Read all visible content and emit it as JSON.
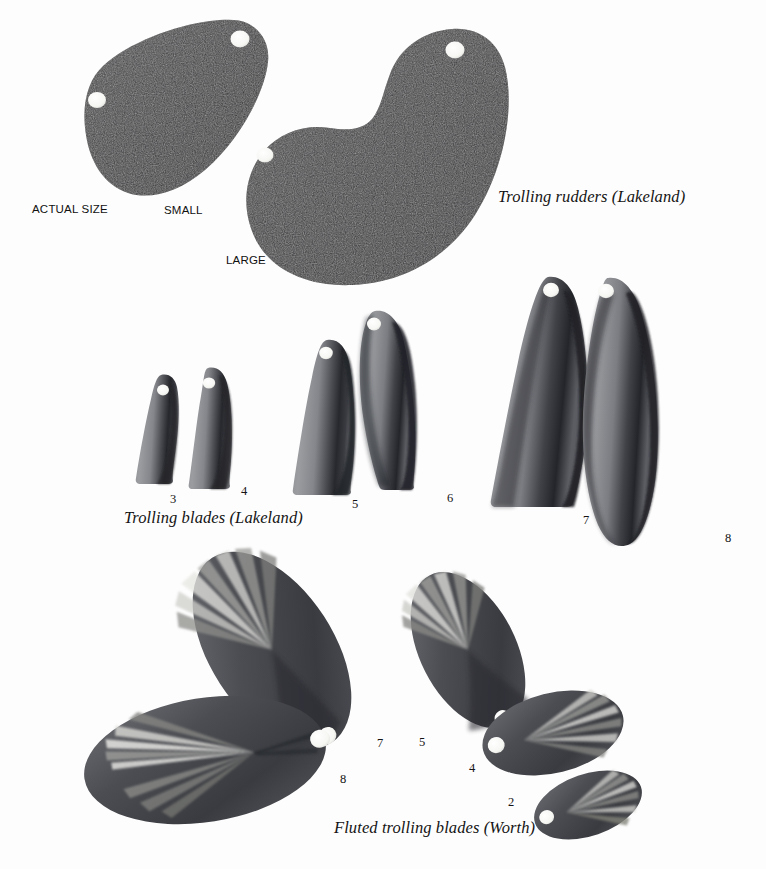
{
  "plate": {
    "width": 766,
    "height": 869,
    "background_color": "#fdfdfd",
    "ink_color": "#141414"
  },
  "groups": [
    {
      "id": "trolling-rudders",
      "caption": "Trolling rudders (Lakeland)",
      "caption_position": {
        "x": 498,
        "y": 187
      },
      "scale_note": "ACTUAL SIZE",
      "scale_note_position": {
        "x": 32,
        "y": 203
      },
      "items": [
        {
          "label": "SMALL",
          "label_position": {
            "x": 164,
            "y": 204
          }
        },
        {
          "label": "LARGE",
          "label_position": {
            "x": 226,
            "y": 254
          }
        }
      ]
    },
    {
      "id": "trolling-blades",
      "caption": "Trolling blades (Lakeland)",
      "caption_position": {
        "x": 124,
        "y": 508
      },
      "items": [
        {
          "label": "3",
          "label_position": {
            "x": 170,
            "y": 492
          }
        },
        {
          "label": "4",
          "label_position": {
            "x": 241,
            "y": 484
          }
        },
        {
          "label": "5",
          "label_position": {
            "x": 352,
            "y": 497
          }
        },
        {
          "label": "6",
          "label_position": {
            "x": 447,
            "y": 491
          }
        },
        {
          "label": "7",
          "label_position": {
            "x": 583,
            "y": 513
          }
        },
        {
          "label": "8",
          "label_position": {
            "x": 725,
            "y": 531
          }
        }
      ]
    },
    {
      "id": "fluted-trolling-blades",
      "caption": "Fluted trolling blades (Worth)",
      "caption_position": {
        "x": 334,
        "y": 818
      },
      "items": [
        {
          "label": "7",
          "label_position": {
            "x": 377,
            "y": 736
          }
        },
        {
          "label": "5",
          "label_position": {
            "x": 419,
            "y": 735
          }
        },
        {
          "label": "4",
          "label_position": {
            "x": 469,
            "y": 761
          }
        },
        {
          "label": "8",
          "label_position": {
            "x": 340,
            "y": 772
          }
        },
        {
          "label": "2",
          "label_position": {
            "x": 508,
            "y": 795
          }
        }
      ]
    }
  ],
  "colors": {
    "rudder_dark": "#3a3a3c",
    "blade_light": "#8f9094",
    "blade_mid": "#6a6b70",
    "blade_dark": "#2d2e33",
    "fluted_dark": "#4a4b50",
    "fluted_highlight": "#e2e2e0",
    "hole_fill": "#fbfbf9"
  }
}
